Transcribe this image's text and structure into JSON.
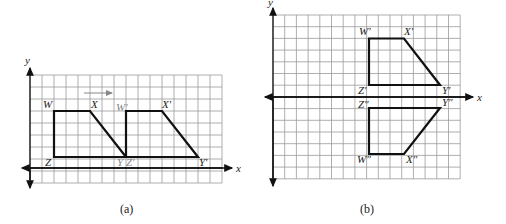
{
  "panel_a": {
    "caption": "(a)",
    "axis_x_label": "x",
    "axis_y_label": "y",
    "grid": {
      "left": 30,
      "top": 75,
      "cols": 16,
      "rows": 9,
      "cell": 12,
      "origin_col": 0,
      "origin_row": 8
    },
    "labels": {
      "W": "W",
      "X": "X",
      "Y": "Y",
      "Z": "Z",
      "W_prime": "W′",
      "X_prime": "X′",
      "Y_prime": "Y′",
      "Z_prime": "Z′"
    },
    "translation_arrow": "→"
  },
  "panel_b": {
    "caption": "(b)",
    "axis_x_label": "x",
    "axis_y_label": "y",
    "grid": {
      "left": 273,
      "top": 15,
      "cols": 16,
      "rows": 14,
      "cell": 11.7
    },
    "labels": {
      "W_prime": "W′",
      "X_prime": "X′",
      "Y_prime": "Y′",
      "Z_prime": "Z′",
      "W_dprime": "W″",
      "X_dprime": "X″",
      "Y_dprime": "Y″",
      "Z_dprime": "Z″"
    }
  }
}
